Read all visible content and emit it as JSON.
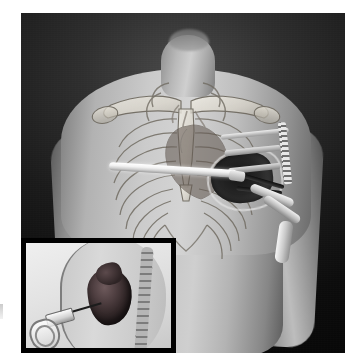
{
  "figure": {
    "domain": "medical-illustration",
    "palette": {
      "backdrop_dark": "#0d0d0d",
      "backdrop_mid": "#2e2e2e",
      "skin_light": "#d4d4d4",
      "skin_mid": "#b2b2b2",
      "skin_shadow": "#6a6a6a",
      "bone": "#e8e4da",
      "bone_outline": "#6f6a60",
      "instrument_white": "#ffffff",
      "instrument_steel": "#9a9a9a",
      "cavity_black": "#151515",
      "heart_maroon": "#4e3e40",
      "inset_background": "#e3e3e3",
      "inset_border": "#000000"
    },
    "plate": {
      "x": 21,
      "y": 13,
      "width": 324,
      "height": 340,
      "border_color": "#000000"
    }
  },
  "main_view": {
    "label": "anterior-chest-view",
    "subject": "male torso, head and neck cropped at top",
    "anatomy": [
      {
        "name": "neck",
        "visible": true
      },
      {
        "name": "clavicle-left",
        "visible": true
      },
      {
        "name": "clavicle-right",
        "visible": true
      },
      {
        "name": "sternum",
        "visible": true
      },
      {
        "name": "rib-cage",
        "visible": true,
        "rib_pairs": 9
      },
      {
        "name": "scapula-left",
        "visible": true
      },
      {
        "name": "scapula-right",
        "visible": true
      },
      {
        "name": "heart",
        "visible": true,
        "position": "left mediastinum"
      },
      {
        "name": "shoulder-left",
        "visible": true
      },
      {
        "name": "shoulder-right",
        "visible": true
      },
      {
        "name": "upper-arm-left",
        "visible": true
      },
      {
        "name": "upper-arm-right",
        "visible": true
      },
      {
        "name": "abdomen",
        "visible": true
      }
    ],
    "instruments": [
      {
        "name": "white-cannula-rod",
        "description": "bright white rod crossing the chest horizontally",
        "orientation": "left-to-right, slight downward tilt"
      },
      {
        "name": "rib-spreader-retractor",
        "description": "ratcheted rib retractor with toothed rack over the left chest"
      },
      {
        "name": "thoracic-access-window",
        "description": "dark open cavity exposing the heart through the intercostal space"
      },
      {
        "name": "vascular-clamp",
        "description": "dark jawed clamp inside the access window"
      },
      {
        "name": "drainage-tube-upper",
        "description": "pale tube running inferolaterally"
      },
      {
        "name": "drainage-tube-lower",
        "description": "second pale tube running inferolaterally"
      },
      {
        "name": "drainage-tube-vertical",
        "description": "pale tube descending along the left lateral chest"
      }
    ]
  },
  "inset_view": {
    "label": "sagittal-inset-panel",
    "position": "lower-left",
    "x": 21,
    "y": 238,
    "width": 155,
    "height": 115,
    "description": "lateral (sagittal) section of the thorax showing instrument insertion toward the heart",
    "elements": [
      {
        "name": "chest-wall-outline",
        "visible": true
      },
      {
        "name": "vertebral-column",
        "visible": true
      },
      {
        "name": "heart",
        "visible": true,
        "color": "#4e3e40"
      },
      {
        "name": "access-needle",
        "visible": true
      },
      {
        "name": "instrument-barrel",
        "visible": true
      },
      {
        "name": "ring-handle",
        "visible": true
      }
    ]
  },
  "annotations": {
    "edge_artifact": "faint scan artifact at left page edge",
    "caption": "",
    "labels": []
  }
}
